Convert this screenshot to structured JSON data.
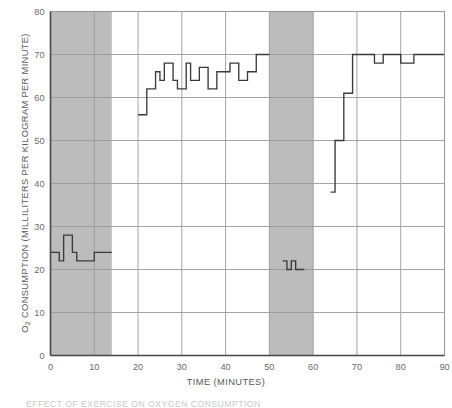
{
  "chart_data": {
    "type": "line",
    "title": "",
    "xlabel": "TIME (MINUTES)",
    "ylabel": "O2 CONSUMPTION (MILLILITERS PER KILOGRAM PER MINUTE)",
    "ylabel_parts": {
      "prefix": "O",
      "sub": "2",
      "suffix": " CONSUMPTION (MILLILITERS PER KILOGRAM PER MINUTE)"
    },
    "xlim": [
      0,
      90
    ],
    "ylim": [
      0,
      80
    ],
    "xticks": [
      0,
      10,
      20,
      30,
      40,
      50,
      60,
      70,
      80,
      90
    ],
    "yticks": [
      0,
      10,
      20,
      30,
      40,
      50,
      60,
      70,
      80
    ],
    "grid": true,
    "grid_color": "#9a9a9c",
    "line_color": "#3a3a3c",
    "shaded_color": "#bcbcbc",
    "plot_bg": "#ffffff",
    "legend": null,
    "shaded_regions": [
      {
        "name": "exercise-period-1",
        "x0": 0,
        "x1": 14
      },
      {
        "name": "exercise-period-2",
        "x0": 50,
        "x1": 60
      }
    ],
    "series": [
      {
        "name": "rest-baseline-1",
        "step": "post",
        "points": [
          {
            "x": 0,
            "y": 24
          },
          {
            "x": 2,
            "y": 24
          },
          {
            "x": 2,
            "y": 22
          },
          {
            "x": 3,
            "y": 22
          },
          {
            "x": 3,
            "y": 28
          },
          {
            "x": 5,
            "y": 28
          },
          {
            "x": 5,
            "y": 24
          },
          {
            "x": 6,
            "y": 24
          },
          {
            "x": 6,
            "y": 22
          },
          {
            "x": 10,
            "y": 22
          },
          {
            "x": 10,
            "y": 24
          },
          {
            "x": 14,
            "y": 24
          }
        ]
      },
      {
        "name": "steady-state-exercise",
        "step": "post",
        "points": [
          {
            "x": 20,
            "y": 56
          },
          {
            "x": 22,
            "y": 56
          },
          {
            "x": 22,
            "y": 62
          },
          {
            "x": 24,
            "y": 62
          },
          {
            "x": 24,
            "y": 66
          },
          {
            "x": 25,
            "y": 66
          },
          {
            "x": 25,
            "y": 64
          },
          {
            "x": 26,
            "y": 64
          },
          {
            "x": 26,
            "y": 68
          },
          {
            "x": 28,
            "y": 68
          },
          {
            "x": 28,
            "y": 64
          },
          {
            "x": 29,
            "y": 64
          },
          {
            "x": 29,
            "y": 62
          },
          {
            "x": 31,
            "y": 62
          },
          {
            "x": 31,
            "y": 68
          },
          {
            "x": 32,
            "y": 68
          },
          {
            "x": 32,
            "y": 64
          },
          {
            "x": 34,
            "y": 64
          },
          {
            "x": 34,
            "y": 67
          },
          {
            "x": 36,
            "y": 67
          },
          {
            "x": 36,
            "y": 62
          },
          {
            "x": 38,
            "y": 62
          },
          {
            "x": 38,
            "y": 66
          },
          {
            "x": 41,
            "y": 66
          },
          {
            "x": 41,
            "y": 68
          },
          {
            "x": 43,
            "y": 68
          },
          {
            "x": 43,
            "y": 64
          },
          {
            "x": 45,
            "y": 64
          },
          {
            "x": 45,
            "y": 66
          },
          {
            "x": 47,
            "y": 66
          },
          {
            "x": 47,
            "y": 70
          },
          {
            "x": 50,
            "y": 70
          }
        ]
      },
      {
        "name": "recovery-low-plateau",
        "step": "post",
        "points": [
          {
            "x": 53,
            "y": 22
          },
          {
            "x": 54,
            "y": 22
          },
          {
            "x": 54,
            "y": 20
          },
          {
            "x": 55,
            "y": 20
          },
          {
            "x": 55,
            "y": 22
          },
          {
            "x": 56,
            "y": 22
          },
          {
            "x": 56,
            "y": 20
          },
          {
            "x": 58,
            "y": 20
          }
        ]
      },
      {
        "name": "recovery-ramp",
        "step": "post",
        "points": [
          {
            "x": 64,
            "y": 38
          },
          {
            "x": 65,
            "y": 38
          },
          {
            "x": 65,
            "y": 50
          },
          {
            "x": 67,
            "y": 50
          },
          {
            "x": 67,
            "y": 61
          },
          {
            "x": 69,
            "y": 61
          },
          {
            "x": 69,
            "y": 70
          },
          {
            "x": 74,
            "y": 70
          },
          {
            "x": 74,
            "y": 68
          },
          {
            "x": 76,
            "y": 68
          },
          {
            "x": 76,
            "y": 70
          },
          {
            "x": 80,
            "y": 70
          },
          {
            "x": 80,
            "y": 68
          },
          {
            "x": 83,
            "y": 68
          },
          {
            "x": 83,
            "y": 70
          },
          {
            "x": 90,
            "y": 70
          }
        ]
      }
    ]
  },
  "caption": {
    "text": "EFFECT OF EXERCISE ON OXYGEN CONSUMPTION"
  }
}
